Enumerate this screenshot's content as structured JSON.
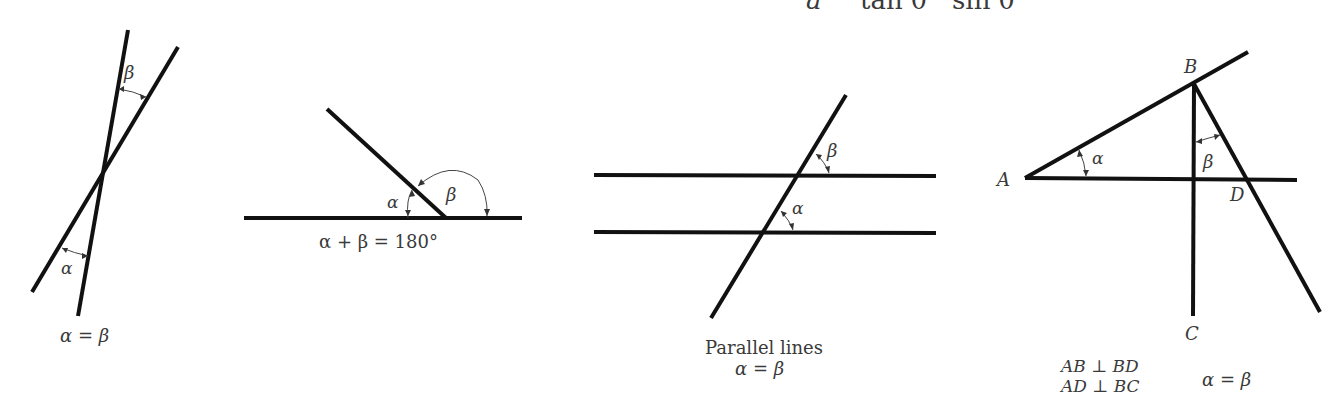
{
  "header_fragment": {
    "a": "a",
    "tan": "tan θ",
    "sin": "sin θ"
  },
  "figures": [
    {
      "id": "intersecting-lines",
      "labels": {
        "beta": "β",
        "alpha": "α"
      },
      "caption": "α = β"
    },
    {
      "id": "supplementary-angles",
      "labels": {
        "alpha": "α",
        "beta": "β"
      },
      "caption": "α + β = 180°"
    },
    {
      "id": "parallel-lines",
      "labels": {
        "beta": "β",
        "alpha": "α"
      },
      "caption_line1": "Parallel lines",
      "caption_line2": "α = β"
    },
    {
      "id": "perpendicular-lines",
      "points": {
        "A": "A",
        "B": "B",
        "C": "C",
        "D": "D"
      },
      "labels": {
        "alpha": "α",
        "beta": "β"
      },
      "caption_line1": "AB ⊥ BD",
      "caption_line2": "AD ⊥ BC",
      "caption_eq": "α = β"
    }
  ]
}
